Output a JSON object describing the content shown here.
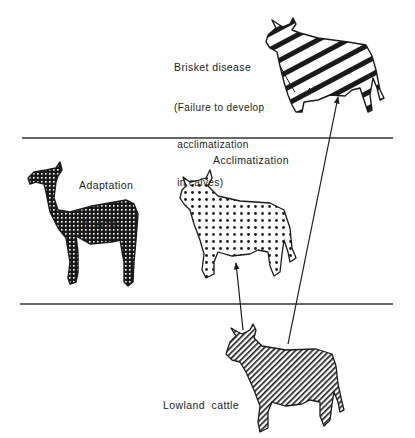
{
  "diagram": {
    "labels": {
      "brisket": {
        "title": "Brisket disease",
        "line1": "(Failure to develop",
        "line2": " acclimatization",
        "line3": " in calves)"
      },
      "adaptation": {
        "line1": "Adaptation",
        "line2": "in llama"
      },
      "acclimatization": "Acclimatization",
      "lowland": "Lowland  cattle"
    },
    "zones": [
      {
        "name": "high-altitude-failure",
        "content": "Brisket disease cattle (striped)"
      },
      {
        "name": "high-altitude-adapted",
        "content": "Llama (cross-hatch) and acclimatized cattle (dotted)"
      },
      {
        "name": "lowland",
        "content": "Lowland cattle (diagonal hatch)"
      }
    ],
    "dividers": [
      {
        "y": 138,
        "x1": 22,
        "x2": 393
      },
      {
        "y": 304,
        "x1": 20,
        "x2": 393
      }
    ],
    "arrows": [
      {
        "from": "Lowland cattle",
        "to": "Acclimatization"
      },
      {
        "from": "Lowland cattle",
        "to": "Brisket disease"
      }
    ],
    "colors": {
      "ink": "#1a1a1a",
      "background": "#ffffff"
    }
  }
}
